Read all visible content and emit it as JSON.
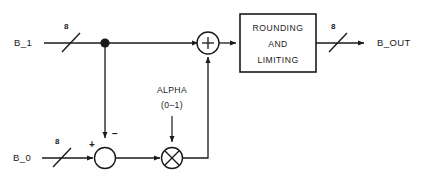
{
  "diagram": {
    "colors": {
      "line": "#1a1a1a",
      "background": "#ffffff",
      "fill": "#ffffff"
    },
    "inputs": [
      {
        "label": "B_1",
        "bit_width": "8"
      },
      {
        "label": "B_0",
        "bit_width": "8"
      }
    ],
    "outputs": [
      {
        "label": "B_OUT",
        "bit_width": "8"
      }
    ],
    "control": {
      "name": "ALPHA",
      "range": "(0–1)"
    },
    "nodes": [
      {
        "name": "subtractor",
        "symbol": "sum-junction",
        "port_signs": {
          "left": "+",
          "top": "−"
        }
      },
      {
        "name": "multiplier",
        "symbol": "⊗"
      },
      {
        "name": "adder",
        "symbol": "+"
      }
    ],
    "block": {
      "name": "rounding-and-limiting",
      "lines": [
        "ROUNDING",
        "AND",
        "LIMITING"
      ]
    }
  }
}
